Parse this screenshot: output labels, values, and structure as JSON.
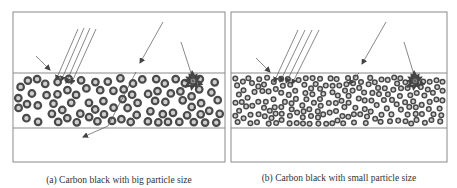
{
  "figure": {
    "panels": [
      {
        "id": "a",
        "caption": "(a) Carbon black with big particle size",
        "particle_size": "big",
        "particle_density": "sparse"
      },
      {
        "id": "b",
        "caption": "(b) Carbon black with small particle size",
        "particle_size": "small",
        "particle_density": "dense"
      }
    ],
    "colors": {
      "frame": "#8a8a8a",
      "ray": "#555555",
      "particle_ring": "#4a4a4a",
      "particle_core": "#cfcfcf",
      "caption_text": "#333333"
    },
    "icons": {
      "incident_ray": "arrow-icon",
      "particle": "ring-particle-icon"
    }
  }
}
